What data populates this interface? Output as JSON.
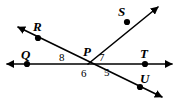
{
  "figure": {
    "type": "geometry-diagram",
    "width": 177,
    "height": 102,
    "background_color": "#ffffff",
    "stroke_color": "#000000"
  },
  "points": [
    {
      "label": "Q",
      "x": 27,
      "y": 64,
      "label_x": 21,
      "label_y": 48,
      "dot": true
    },
    {
      "label": "R",
      "x": 38,
      "y": 38,
      "label_x": 33,
      "label_y": 20,
      "dot": true
    },
    {
      "label": "P",
      "x": 88,
      "y": 64,
      "label_x": 83,
      "label_y": 45,
      "dot": false
    },
    {
      "label": "S",
      "x": 127,
      "y": 22,
      "label_x": 118,
      "label_y": 5,
      "dot": true
    },
    {
      "label": "T",
      "x": 145,
      "y": 64,
      "label_x": 140,
      "label_y": 47,
      "dot": true
    },
    {
      "label": "U",
      "x": 140,
      "y": 87,
      "label_x": 140,
      "label_y": 72,
      "dot": true
    }
  ],
  "angles": [
    {
      "label": "8",
      "x": 59,
      "y": 52
    },
    {
      "label": "6",
      "x": 81,
      "y": 68
    },
    {
      "label": "7",
      "x": 99,
      "y": 52
    },
    {
      "label": "5",
      "x": 104,
      "y": 67
    }
  ],
  "lines": [
    {
      "name": "line-QT",
      "from": {
        "x": 7,
        "y": 64
      },
      "to": {
        "x": 172,
        "y": 64
      },
      "arrows": "both"
    },
    {
      "name": "line-RU",
      "from": {
        "x": 18,
        "y": 27
      },
      "to": {
        "x": 162,
        "y": 97
      },
      "arrows": "both"
    },
    {
      "name": "ray-PS",
      "from": {
        "x": 88,
        "y": 64
      },
      "to": {
        "x": 158,
        "y": 7
      },
      "arrows": "end"
    }
  ]
}
